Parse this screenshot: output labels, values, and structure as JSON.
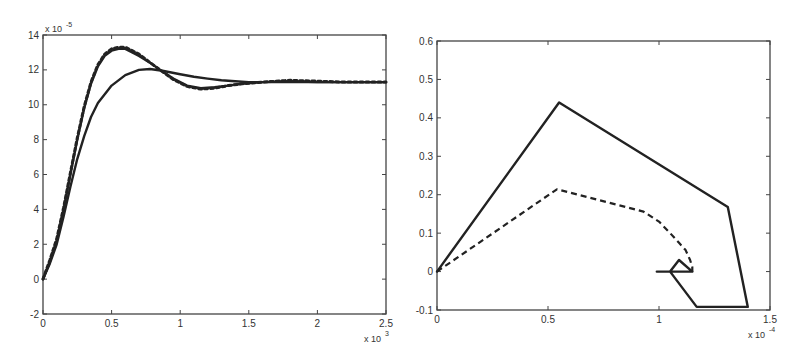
{
  "chart_data": [
    {
      "id": "left",
      "type": "line",
      "title": "",
      "xlabel": "",
      "ylabel": "",
      "x_multiplier": "x 10",
      "x_multiplier_exp": "3",
      "y_multiplier": "x 10",
      "y_multiplier_exp": "-5",
      "xlim": [
        0,
        2.5
      ],
      "ylim": [
        -2,
        14
      ],
      "xticks": [
        0,
        0.5,
        1,
        1.5,
        2,
        2.5
      ],
      "xtick_labels": [
        "0",
        "0.5",
        "1",
        "1.5",
        "2",
        "2.5"
      ],
      "yticks": [
        -2,
        0,
        2,
        4,
        6,
        8,
        10,
        12,
        14
      ],
      "ytick_labels": [
        "-2",
        "0",
        "2",
        "4",
        "6",
        "8",
        "10",
        "12",
        "14"
      ],
      "grid": false,
      "legend": null,
      "frame": {
        "left": 43,
        "top": 35,
        "right": 386,
        "bottom": 314
      },
      "series": [
        {
          "name": "fast response (solid)",
          "style": "solid",
          "x": [
            0,
            0.05,
            0.1,
            0.15,
            0.2,
            0.25,
            0.3,
            0.35,
            0.4,
            0.45,
            0.5,
            0.55,
            0.6,
            0.65,
            0.7,
            0.8,
            0.87,
            0.95,
            1.05,
            1.15,
            1.25,
            1.35,
            1.45,
            1.6,
            1.8,
            2.0,
            2.2,
            2.5
          ],
          "y": [
            0,
            1.0,
            2.2,
            4.0,
            6.0,
            8.0,
            9.8,
            11.2,
            12.2,
            12.8,
            13.1,
            13.2,
            13.2,
            13.0,
            12.8,
            12.3,
            11.9,
            11.5,
            11.1,
            10.95,
            11.0,
            11.1,
            11.2,
            11.3,
            11.35,
            11.3,
            11.3,
            11.3
          ]
        },
        {
          "name": "fast response reference (dotted)",
          "style": "dotted",
          "x": [
            0,
            0.05,
            0.1,
            0.15,
            0.2,
            0.25,
            0.3,
            0.35,
            0.4,
            0.45,
            0.5,
            0.55,
            0.6,
            0.65,
            0.7,
            0.8,
            0.87,
            0.95,
            1.05,
            1.15,
            1.25,
            1.35,
            1.45,
            1.6,
            1.8,
            2.0,
            2.2,
            2.5
          ],
          "y": [
            0,
            1.1,
            2.3,
            4.1,
            6.1,
            8.1,
            9.9,
            11.3,
            12.3,
            12.9,
            13.2,
            13.3,
            13.3,
            13.1,
            12.9,
            12.3,
            11.9,
            11.45,
            11.05,
            10.9,
            10.95,
            11.1,
            11.2,
            11.3,
            11.4,
            11.35,
            11.3,
            11.3
          ]
        },
        {
          "name": "slow response (solid)",
          "style": "solid",
          "x": [
            0,
            0.05,
            0.1,
            0.15,
            0.2,
            0.25,
            0.3,
            0.35,
            0.4,
            0.5,
            0.6,
            0.7,
            0.78,
            0.87,
            1.0,
            1.1,
            1.2,
            1.3,
            1.4,
            1.5,
            1.7,
            2.0,
            2.5
          ],
          "y": [
            0,
            0.9,
            2.0,
            3.6,
            5.3,
            6.9,
            8.2,
            9.3,
            10.1,
            11.1,
            11.7,
            12.0,
            12.05,
            11.95,
            11.75,
            11.6,
            11.5,
            11.4,
            11.35,
            11.3,
            11.3,
            11.3,
            11.3
          ]
        }
      ]
    },
    {
      "id": "right",
      "type": "line",
      "title": "",
      "xlabel": "",
      "ylabel": "",
      "x_multiplier": "x 10",
      "x_multiplier_exp": "-4",
      "xlim": [
        0,
        1.5
      ],
      "ylim": [
        -0.1,
        0.6
      ],
      "xticks": [
        0,
        0.5,
        1,
        1.5
      ],
      "xtick_labels": [
        "0",
        "0.5",
        "1",
        "1.5"
      ],
      "yticks": [
        -0.1,
        0,
        0.1,
        0.2,
        0.3,
        0.4,
        0.5,
        0.6
      ],
      "ytick_labels": [
        "-0.1",
        "0",
        "0.1",
        "0.2",
        "0.3",
        "0.4",
        "0.5",
        "0.6"
      ],
      "grid": false,
      "legend": null,
      "frame": {
        "left": 437,
        "top": 41,
        "right": 770,
        "bottom": 310
      },
      "series": [
        {
          "name": "trajectory (solid)",
          "style": "solid",
          "x": [
            0,
            0.55,
            1.31,
            1.4,
            1.17,
            1.05,
            1.09,
            1.15,
            1.05,
            0.99,
            1.15
          ],
          "y": [
            0,
            0.44,
            0.168,
            -0.092,
            -0.092,
            0.0,
            0.03,
            0.0,
            0.0,
            0.0,
            0.0
          ]
        },
        {
          "name": "trajectory (dashed)",
          "style": "dashed",
          "x": [
            0,
            0.54,
            0.93,
            1.0,
            1.05,
            1.09,
            1.12,
            1.14,
            1.15,
            1.15
          ],
          "y": [
            0,
            0.214,
            0.156,
            0.13,
            0.1,
            0.075,
            0.056,
            0.03,
            0.012,
            0.0
          ]
        }
      ]
    }
  ]
}
